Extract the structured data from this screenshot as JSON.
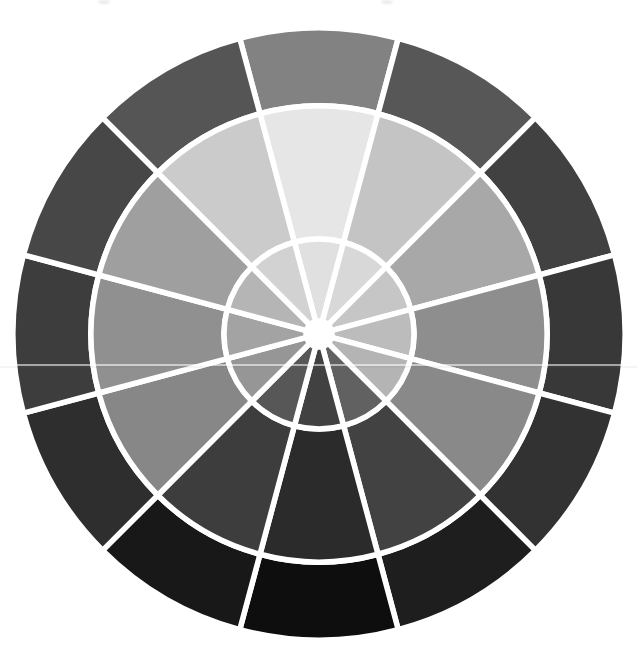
{
  "page": {
    "background_color": "#ffffff",
    "width": 637,
    "height": 655
  },
  "wheel": {
    "kind": "grayscale-color-value-wheel",
    "center_x": 319,
    "center_y": 334,
    "outer_radius": 306,
    "middle_radius": 228,
    "inner_radius": 95,
    "hub_radius": 13,
    "gap_color": "#ffffff",
    "gap_width": 5.5,
    "segment_count": 12,
    "ring_order": [
      "outer",
      "middle",
      "inner"
    ],
    "segments": [
      {
        "position": "12-oclock",
        "outer": "#828282",
        "middle": "#e6e6e6",
        "inner": "#e0e0e0"
      },
      {
        "position": "1-oclock",
        "outer": "#575757",
        "middle": "#c4c4c4",
        "inner": "#d8d8d8"
      },
      {
        "position": "2-oclock",
        "outer": "#414141",
        "middle": "#a8a8a8",
        "inner": "#c6c6c6"
      },
      {
        "position": "3-oclock",
        "outer": "#383838",
        "middle": "#8e8e8e",
        "inner": "#bcbcbc"
      },
      {
        "position": "4-oclock",
        "outer": "#323232",
        "middle": "#898989",
        "inner": "#b4b4b4"
      },
      {
        "position": "5-oclock",
        "outer": "#1e1e1e",
        "middle": "#424242",
        "inner": "#616161"
      },
      {
        "position": "6-oclock",
        "outer": "#0e0e0e",
        "middle": "#2b2b2b",
        "inner": "#414141"
      },
      {
        "position": "7-oclock",
        "outer": "#181818",
        "middle": "#3d3d3d",
        "inner": "#575757"
      },
      {
        "position": "8-oclock",
        "outer": "#2e2e2e",
        "middle": "#878787",
        "inner": "#969696"
      },
      {
        "position": "9-oclock",
        "outer": "#3d3d3d",
        "middle": "#909090",
        "inner": "#a3a3a3"
      },
      {
        "position": "10-oclock",
        "outer": "#474747",
        "middle": "#9f9f9f",
        "inner": "#b5b5b5"
      },
      {
        "position": "11-oclock",
        "outer": "#555555",
        "middle": "#cbcbcb",
        "inner": "#d2d2d2"
      }
    ]
  },
  "artifacts": {
    "scan_line_y": 364,
    "smudges": [
      {
        "x": 98,
        "y": 0
      },
      {
        "x": 381,
        "y": 0
      }
    ]
  }
}
